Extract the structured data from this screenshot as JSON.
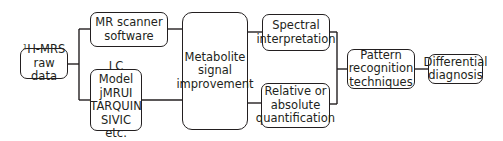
{
  "diagram": {
    "title": "",
    "nodes": [
      {
        "id": "raw",
        "sup": "1",
        "label": "H-MRS\nraw data"
      },
      {
        "id": "scanner",
        "label": "MR scanner\nsoftware"
      },
      {
        "id": "tools",
        "label": "LC Model\njMRUI\nTARQUIN\nSIVIC etc."
      },
      {
        "id": "metab",
        "label": "Metabolite\nsignal\nimprovement"
      },
      {
        "id": "spectral",
        "label": "Spectral\ninterpretation"
      },
      {
        "id": "quant",
        "label": "Relative or\nabsolute\nquantification"
      },
      {
        "id": "pattern",
        "label": "Pattern\nrecognition\ntechniques"
      },
      {
        "id": "diff",
        "label": "Differential\ndiagnosis"
      }
    ],
    "edges": [
      [
        "raw",
        "scanner"
      ],
      [
        "raw",
        "tools"
      ],
      [
        "scanner",
        "metab"
      ],
      [
        "tools",
        "metab"
      ],
      [
        "metab",
        "spectral"
      ],
      [
        "metab",
        "quant"
      ],
      [
        "spectral",
        "pattern"
      ],
      [
        "quant",
        "pattern"
      ],
      [
        "pattern",
        "diff"
      ]
    ],
    "line_color": "#231f20"
  }
}
